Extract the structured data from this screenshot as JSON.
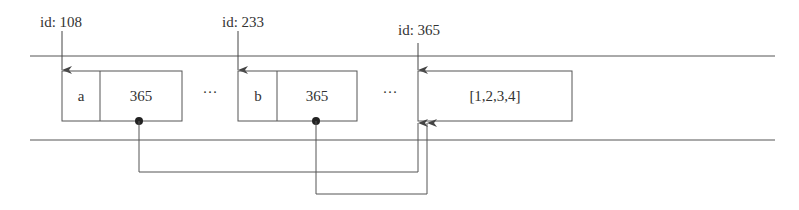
{
  "diagram": {
    "type": "memory-reference-diagram",
    "colors": {
      "line": "#555555",
      "text": "#333333",
      "background": "#ffffff"
    },
    "variables": [
      {
        "id_label": "id: 108",
        "name": "a",
        "value": "365"
      },
      {
        "id_label": "id: 233",
        "name": "b",
        "value": "365"
      }
    ],
    "object": {
      "id_label": "id: 365",
      "value": "[1,2,3,4]"
    },
    "ellipsis": [
      "···",
      "···"
    ],
    "references": [
      {
        "from": "a",
        "to": "id: 365"
      },
      {
        "from": "b",
        "to": "id: 365"
      }
    ]
  }
}
